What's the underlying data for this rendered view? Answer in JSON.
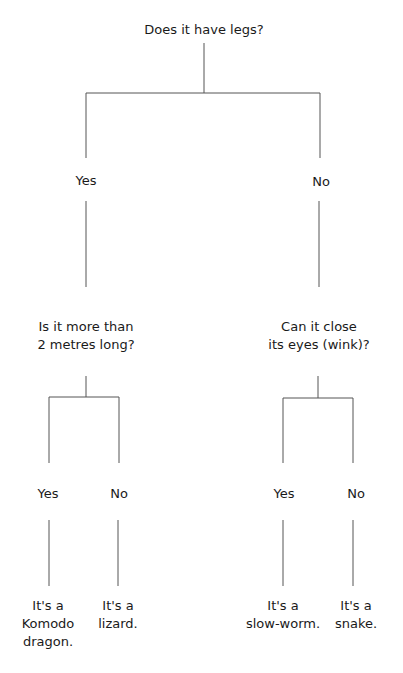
{
  "diagram": {
    "type": "decision-tree",
    "line_color": "#555555",
    "text_color": "#1a1a1a",
    "root": {
      "question": "Does it have legs?"
    },
    "branches": {
      "yes_label": "Yes",
      "no_label": "No"
    },
    "left": {
      "question_line1": "Is it more than",
      "question_line2": "2 metres long?",
      "yes_label": "Yes",
      "no_label": "No",
      "yes_result": [
        "It's a",
        "Komodo",
        "dragon."
      ],
      "no_result": [
        "It's a",
        "lizard."
      ]
    },
    "right": {
      "question_line1": "Can it close",
      "question_line2": "its eyes (wink)?",
      "yes_label": "Yes",
      "no_label": "No",
      "yes_result": [
        "It's a",
        "slow-worm."
      ],
      "no_result": [
        "It's a",
        "snake."
      ]
    }
  }
}
